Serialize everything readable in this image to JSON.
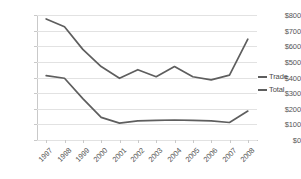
{
  "chart_data": {
    "type": "line",
    "title": "",
    "xlabel": "",
    "ylabel": "",
    "ylim": [
      0,
      800
    ],
    "ytick_step": 100,
    "grid": true,
    "legend_position": "right",
    "categories": [
      "1997",
      "1998",
      "1999",
      "2000",
      "2001",
      "2002",
      "2003",
      "2004",
      "2005",
      "2006",
      "2007",
      "2008"
    ],
    "ytick_labels": [
      "$800",
      "$700",
      "$600",
      "$500",
      "$400",
      "$300",
      "$200",
      "$100",
      "$0"
    ],
    "ytick_values": [
      800,
      700,
      600,
      500,
      400,
      300,
      200,
      100,
      0
    ],
    "series": [
      {
        "name": "Trade",
        "color": "#5e5e5e",
        "values": [
          775,
          725,
          580,
          470,
          395,
          450,
          405,
          470,
          405,
          385,
          415,
          645
        ]
      },
      {
        "name": "Total",
        "color": "#5e5e5e",
        "values": [
          412,
          395,
          265,
          145,
          108,
          122,
          125,
          128,
          125,
          123,
          112,
          185
        ]
      }
    ]
  },
  "legend": {
    "entries": [
      {
        "label": "Trade"
      },
      {
        "label": "Total"
      }
    ]
  },
  "colors": {
    "series_line": "#5e5e5e",
    "gridline": "#e2e2e2",
    "axis": "#c9c9c9",
    "tick_text": "#555555"
  }
}
